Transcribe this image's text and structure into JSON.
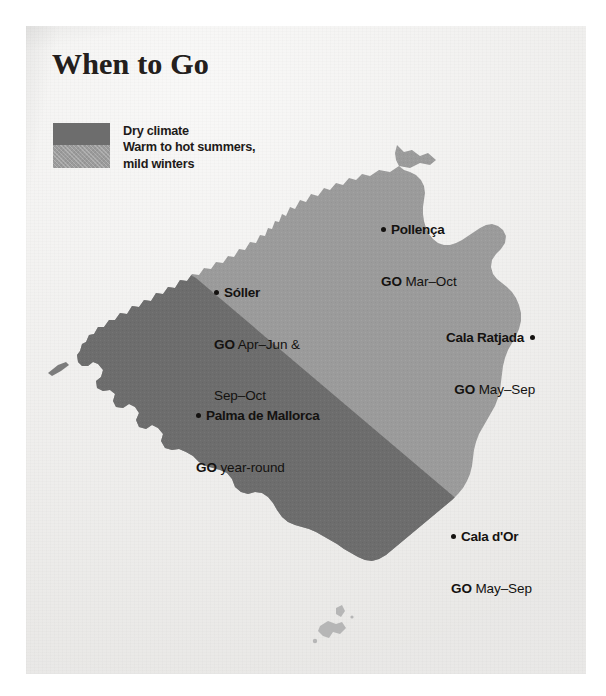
{
  "page": {
    "title": "When to Go",
    "background_color": "#f1f0ee",
    "text_color": "#141210"
  },
  "legend": {
    "swatch_dark_color": "#6d6d6d",
    "swatch_light_color": "#9b9b9b",
    "line1": "Dry climate",
    "line2": "Warm to hot summers,",
    "line3": "mild winters"
  },
  "map": {
    "region_name": "Mallorca",
    "zone_dry_color": "#6d6d6d",
    "zone_warm_color": "#9b9b9b",
    "places": [
      {
        "name": "Pollença",
        "go_label": "GO",
        "go_value": "Mar–Oct",
        "marker": "left",
        "x": 381,
        "y": 186
      },
      {
        "name": "Sóller",
        "go_label": "GO",
        "go_value": "Apr–Jun &",
        "go_value2": "Sep–Oct",
        "marker": "left",
        "x": 214,
        "y": 249
      },
      {
        "name": "Cala Ratjada",
        "go_label": "GO",
        "go_value": "May–Sep",
        "marker": "right",
        "x": 446,
        "y": 294
      },
      {
        "name": "Palma de Mallorca",
        "go_label": "GO",
        "go_value": "year-round",
        "marker": "left",
        "x": 196,
        "y": 372
      },
      {
        "name": "Cala d'Or",
        "go_label": "GO",
        "go_value": "May–Sep",
        "marker": "left",
        "x": 451,
        "y": 493
      }
    ]
  }
}
